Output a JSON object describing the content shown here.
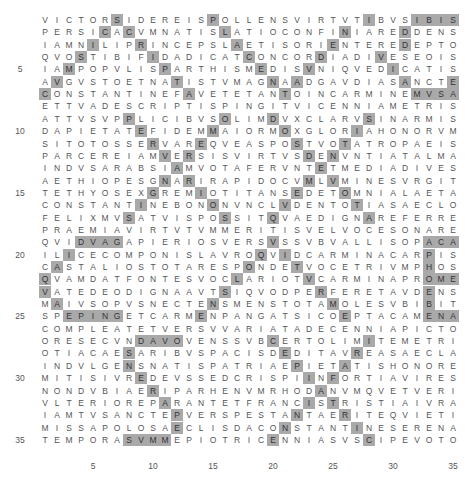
{
  "grid": {
    "rows": 35,
    "cols": 35,
    "highlight_color": "#a9a9a9",
    "lines": [
      "VICTORSIDEREISPOLLENSVIRTVTIBVSIBIS",
      "PERSICACVMNATISLATIOCONFINIAREDDENS",
      "IAMNILIPRINCEPSLAETISORIENTEREDEPTO",
      "QVOSTIBIFIDADICATCONCORDIADIVESEOIS",
      "IAMPOPVLISPARTHISMEDISVNIQVEDICATIS",
      "AVGVSTOETNATISTVMAGNAADGAVDIASANCTE",
      "CONSTANTINEFAVETETANTOINCARMINEMVSA",
      "ETTVADESCRIPTISPINGITVICENNIAMETRIS",
      "ATTVSVPPLICIBVSOLIMDVXCLARVSINARMIS",
      "DAPIETATEFIDEMMAIORMOXGLORIAHONORVM",
      "SITOTOSSERVAREQVEASPOSTVOTATROPAEIS",
      "PARCEREIAMVERSISVIRTVSDENVNTIATALMA",
      "INDVSARABSIAMVOTAFERVNTETMEDIADIVES",
      "AETHIOPESGNARIRAPIDOCVMLVMINESVRGIT",
      "TETHYOSEXGREMIOTITANSEDETOMNIALAETA",
      "CONSTANTINEBONONVNCLVDENTOTIASAECLO",
      "FELIXMVSATVISPOSSITQVAEDIGNAREFERRE",
      "PRAEMIAVIRTVTVMMERITISVELVOCESONARE",
      "QVIDVAGAPIERIOSVERSVSSVBVALLISOPACA",
      "ILICECOMPONISLAVROQVIDCARMINACARPIS",
      "CASTALIOSTOTARESPONDETVOCETRIVMPHOS",
      "QVAMDATFONTESVOCLARIOTVCARMINAPROME",
      "VATEDEODIGNAAVTSIQVODPERFERETAVDENS",
      "MAIVSOPVSNECTENSMENSTOTAMOLESVBIBIT",
      "SPEPINGETCARMENPANGATSICOEPTACAMENA",
      "COMPLEATETVERSVVARIATADECENNIAPICTO",
      "ORESECVNDAVOVENSSVBCERTOLIMITEMETRI",
      "OTIACAESARIBVSPACISDEDITAVREASAECLA",
      "INDVLGENSNATISPATRIAEPIETATISHONORE",
      "MITISIVREDEVSSEDCRISPIINFORTIAVIRES",
      "NONDVBIAERIPARHENVMRHODANVMQVETVERI",
      "VLTERIOREPARANTETFRANCISTRISTIAIVRA",
      "IAMTVSANCTEPVERSPESTANTAERITEQVIETI",
      "MISSAPOLOSAECLISDACONSTANTINESERENA",
      "TEMPORASVMMEPIOTRICENNIASVSCIPEVOTO"
    ],
    "highlights": [
      [
        7,
        15,
        28,
        32,
        33,
        34,
        35
      ],
      [
        6,
        8,
        16,
        26,
        31
      ],
      [
        5,
        9,
        17,
        25,
        31
      ],
      [
        4,
        10,
        18,
        24,
        29
      ],
      [
        3,
        11,
        19,
        23,
        30
      ],
      [
        2,
        12,
        20,
        22,
        31,
        35
      ],
      [
        1,
        13,
        21,
        32,
        33,
        34,
        35
      ],
      [],
      [
        8,
        16,
        20,
        28
      ],
      [
        9,
        15,
        21,
        27
      ],
      [
        10,
        14,
        22,
        26
      ],
      [
        11,
        13,
        23,
        25
      ],
      [
        12,
        24
      ],
      [
        11,
        13,
        23,
        25
      ],
      [
        10,
        14,
        22,
        26
      ],
      [
        9,
        15,
        21,
        27
      ],
      [
        8,
        16,
        20,
        28
      ],
      [],
      [
        4,
        5,
        6,
        7,
        20,
        33,
        34,
        35
      ],
      [
        3,
        19,
        21,
        33
      ],
      [
        2,
        18,
        22,
        33
      ],
      [
        1,
        17,
        23,
        33,
        34,
        35
      ],
      [
        1,
        16,
        24,
        33
      ],
      [
        2,
        15,
        25,
        33
      ],
      [
        3,
        4,
        5,
        6,
        7,
        14,
        26,
        33,
        34,
        35
      ],
      [],
      [
        9,
        10,
        11,
        12,
        20,
        28
      ],
      [
        8,
        21,
        27
      ],
      [
        8,
        22,
        26
      ],
      [
        9,
        23,
        25
      ],
      [
        10,
        24
      ],
      [
        11,
        23,
        25
      ],
      [
        12,
        22,
        26
      ],
      [
        12,
        21,
        27
      ],
      [
        8,
        9,
        10,
        11,
        20,
        28
      ]
    ],
    "row_labels": [
      {
        "row": 5,
        "label": "5"
      },
      {
        "row": 10,
        "label": "10"
      },
      {
        "row": 15,
        "label": "15"
      },
      {
        "row": 20,
        "label": "20"
      },
      {
        "row": 25,
        "label": "25"
      },
      {
        "row": 30,
        "label": "30"
      },
      {
        "row": 35,
        "label": "35"
      }
    ],
    "col_labels": [
      {
        "col": 5,
        "label": "5"
      },
      {
        "col": 10,
        "label": "10"
      },
      {
        "col": 15,
        "label": "15"
      },
      {
        "col": 20,
        "label": "20"
      },
      {
        "col": 25,
        "label": "25"
      },
      {
        "col": 30,
        "label": "30"
      },
      {
        "col": 35,
        "label": "35"
      }
    ]
  }
}
